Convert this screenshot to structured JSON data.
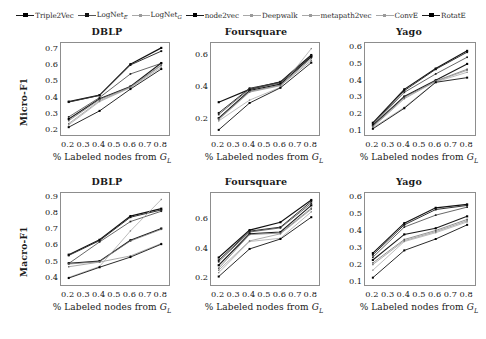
{
  "legend": {
    "entries": [
      {
        "label": "Triple2Vec",
        "sub": "",
        "style": "bold"
      },
      {
        "label": "LogNet",
        "sub": "E",
        "style": "normal"
      },
      {
        "label": "LogNet",
        "sub": "G",
        "style": "light"
      },
      {
        "label": "node2vec",
        "sub": "",
        "style": "bold"
      },
      {
        "label": "Deepwalk",
        "sub": "",
        "style": "light"
      },
      {
        "label": "metapath2vec",
        "sub": "",
        "style": "light"
      },
      {
        "label": "ConvE",
        "sub": "",
        "style": "light"
      },
      {
        "label": "RotatE",
        "sub": "",
        "style": "bold"
      }
    ]
  },
  "axes": {
    "xlabel_prefix": "% Labeled nodes from ",
    "xlabel_symbol": "G",
    "xlabel_sub": "L",
    "ylabel_micro": "Micro-F1",
    "ylabel_macro": "Macro-F1"
  },
  "chart_data": [
    {
      "type": "line",
      "title": "DBLP",
      "panel": "micro-dblp",
      "xlabel": "% Labeled nodes from G_L",
      "ylabel": "Micro-F1",
      "x": [
        0.2,
        0.4,
        0.6,
        0.8
      ],
      "xticks": [
        0.2,
        0.3,
        0.4,
        0.5,
        0.6,
        0.7,
        0.8
      ],
      "xlim": [
        0.15,
        0.85
      ],
      "yticks": [
        0.2,
        0.3,
        0.4,
        0.5,
        0.6,
        0.7
      ],
      "ylim": [
        0.17,
        0.735
      ],
      "grid": false,
      "series": [
        {
          "name": "Triple2Vec",
          "values": [
            0.375,
            0.415,
            0.605,
            0.705
          ]
        },
        {
          "name": "LogNet_E",
          "values": [
            0.372,
            0.413,
            0.6,
            0.685
          ]
        },
        {
          "name": "LogNet_G",
          "values": [
            0.281,
            0.4,
            0.545,
            0.61
          ]
        },
        {
          "name": "node2vec",
          "values": [
            0.268,
            0.392,
            0.468,
            0.612
          ]
        },
        {
          "name": "Deepwalk",
          "values": [
            0.258,
            0.388,
            0.465,
            0.6
          ]
        },
        {
          "name": "metapath2vec",
          "values": [
            0.24,
            0.38,
            0.462,
            0.596
          ]
        },
        {
          "name": "ConvE",
          "values": [
            0.232,
            0.375,
            0.46,
            0.585
          ]
        },
        {
          "name": "RotatE",
          "values": [
            0.218,
            0.318,
            0.452,
            0.575
          ]
        }
      ]
    },
    {
      "type": "line",
      "title": "Foursquare",
      "panel": "micro-foursquare",
      "xlabel": "% Labeled nodes from G_L",
      "ylabel": "Micro-F1",
      "x": [
        0.2,
        0.4,
        0.6,
        0.8
      ],
      "xticks": [
        0.2,
        0.3,
        0.4,
        0.5,
        0.6,
        0.7,
        0.8
      ],
      "xlim": [
        0.15,
        0.85
      ],
      "yticks": [
        0.2,
        0.4,
        0.6
      ],
      "ylim": [
        0.1,
        0.675
      ],
      "grid": false,
      "series": [
        {
          "name": "Triple2Vec",
          "values": [
            0.305,
            0.385,
            0.432,
            0.6
          ]
        },
        {
          "name": "LogNet_E",
          "values": [
            0.238,
            0.392,
            0.43,
            0.595
          ]
        },
        {
          "name": "LogNet_G",
          "values": [
            0.228,
            0.388,
            0.425,
            0.592
          ]
        },
        {
          "name": "node2vec",
          "values": [
            0.205,
            0.378,
            0.418,
            0.588
          ]
        },
        {
          "name": "Deepwalk",
          "values": [
            0.2,
            0.372,
            0.412,
            0.578
          ]
        },
        {
          "name": "metapath2vec",
          "values": [
            0.196,
            0.368,
            0.408,
            0.565
          ]
        },
        {
          "name": "ConvE",
          "values": [
            0.188,
            0.318,
            0.398,
            0.64
          ]
        },
        {
          "name": "RotatE",
          "values": [
            0.132,
            0.3,
            0.395,
            0.552
          ]
        }
      ]
    },
    {
      "type": "line",
      "title": "Yago",
      "panel": "micro-yago",
      "xlabel": "% Labeled nodes from G_L",
      "ylabel": "Micro-F1",
      "x": [
        0.2,
        0.4,
        0.6,
        0.8
      ],
      "xticks": [
        0.2,
        0.3,
        0.4,
        0.5,
        0.6,
        0.7,
        0.8
      ],
      "xlim": [
        0.15,
        0.85
      ],
      "yticks": [
        0.1,
        0.2,
        0.3,
        0.4,
        0.5,
        0.6
      ],
      "ylim": [
        0.075,
        0.625
      ],
      "grid": false,
      "series": [
        {
          "name": "Triple2Vec",
          "values": [
            0.148,
            0.348,
            0.472,
            0.578
          ]
        },
        {
          "name": "LogNet_E",
          "values": [
            0.142,
            0.34,
            0.468,
            0.57
          ]
        },
        {
          "name": "LogNet_G",
          "values": [
            0.135,
            0.33,
            0.44,
            0.54
          ]
        },
        {
          "name": "node2vec",
          "values": [
            0.132,
            0.305,
            0.402,
            0.5
          ]
        },
        {
          "name": "Deepwalk",
          "values": [
            0.128,
            0.3,
            0.398,
            0.468
          ]
        },
        {
          "name": "metapath2vec",
          "values": [
            0.122,
            0.292,
            0.395,
            0.462
          ]
        },
        {
          "name": "ConvE",
          "values": [
            0.118,
            0.24,
            0.392,
            0.45
          ]
        },
        {
          "name": "RotatE",
          "values": [
            0.112,
            0.235,
            0.39,
            0.418
          ]
        }
      ]
    },
    {
      "type": "line",
      "title": "DBLP",
      "panel": "macro-dblp",
      "xlabel": "% Labeled nodes from G_L",
      "ylabel": "Macro-F1",
      "x": [
        0.2,
        0.4,
        0.6,
        0.8
      ],
      "xticks": [
        0.2,
        0.3,
        0.4,
        0.5,
        0.6,
        0.7,
        0.8
      ],
      "xlim": [
        0.15,
        0.85
      ],
      "yticks": [
        0.4,
        0.5,
        0.6,
        0.7,
        0.8,
        0.9
      ],
      "ylim": [
        0.355,
        0.925
      ],
      "grid": false,
      "series": [
        {
          "name": "Triple2Vec",
          "values": [
            0.543,
            0.635,
            0.782,
            0.828
          ]
        },
        {
          "name": "LogNet_E",
          "values": [
            0.538,
            0.63,
            0.775,
            0.82
          ]
        },
        {
          "name": "LogNet_G",
          "values": [
            0.488,
            0.622,
            0.748,
            0.812
          ]
        },
        {
          "name": "node2vec",
          "values": [
            0.49,
            0.503,
            0.632,
            0.705
          ]
        },
        {
          "name": "Deepwalk",
          "values": [
            0.485,
            0.5,
            0.628,
            0.7
          ]
        },
        {
          "name": "metapath2vec",
          "values": [
            0.468,
            0.497,
            0.535,
            0.612
          ]
        },
        {
          "name": "ConvE",
          "values": [
            0.402,
            0.47,
            0.69,
            0.885
          ]
        },
        {
          "name": "RotatE",
          "values": [
            0.398,
            0.465,
            0.528,
            0.608
          ]
        }
      ]
    },
    {
      "type": "line",
      "title": "Foursquare",
      "panel": "macro-foursquare",
      "xlabel": "% Labeled nodes from G_L",
      "ylabel": "Macro-F1",
      "x": [
        0.2,
        0.4,
        0.6,
        0.8
      ],
      "xticks": [
        0.2,
        0.3,
        0.4,
        0.5,
        0.6,
        0.7,
        0.8
      ],
      "xlim": [
        0.15,
        0.85
      ],
      "yticks": [
        0.2,
        0.4,
        0.6
      ],
      "ylim": [
        0.155,
        0.775
      ],
      "grid": false,
      "series": [
        {
          "name": "Triple2Vec",
          "values": [
            0.34,
            0.525,
            0.578,
            0.728
          ]
        },
        {
          "name": "LogNet_E",
          "values": [
            0.322,
            0.518,
            0.545,
            0.718
          ]
        },
        {
          "name": "LogNet_G",
          "values": [
            0.312,
            0.512,
            0.54,
            0.705
          ]
        },
        {
          "name": "node2vec",
          "values": [
            0.288,
            0.5,
            0.512,
            0.692
          ]
        },
        {
          "name": "Deepwalk",
          "values": [
            0.268,
            0.495,
            0.505,
            0.672
          ]
        },
        {
          "name": "metapath2vec",
          "values": [
            0.255,
            0.452,
            0.5,
            0.665
          ]
        },
        {
          "name": "ConvE",
          "values": [
            0.238,
            0.448,
            0.47,
            0.648
          ]
        },
        {
          "name": "RotatE",
          "values": [
            0.212,
            0.398,
            0.465,
            0.612
          ]
        }
      ]
    },
    {
      "type": "line",
      "title": "Yago",
      "panel": "macro-yago",
      "xlabel": "% Labeled nodes from G_L",
      "ylabel": "Macro-F1",
      "x": [
        0.2,
        0.4,
        0.6,
        0.8
      ],
      "xticks": [
        0.2,
        0.3,
        0.4,
        0.5,
        0.6,
        0.7,
        0.8
      ],
      "xlim": [
        0.15,
        0.85
      ],
      "yticks": [
        0.1,
        0.2,
        0.3,
        0.4,
        0.5,
        0.6
      ],
      "ylim": [
        0.085,
        0.625
      ],
      "grid": false,
      "series": [
        {
          "name": "Triple2Vec",
          "values": [
            0.272,
            0.448,
            0.538,
            0.558
          ]
        },
        {
          "name": "LogNet_E",
          "values": [
            0.262,
            0.438,
            0.528,
            0.552
          ]
        },
        {
          "name": "LogNet_G",
          "values": [
            0.248,
            0.425,
            0.495,
            0.542
          ]
        },
        {
          "name": "node2vec",
          "values": [
            0.232,
            0.382,
            0.418,
            0.488
          ]
        },
        {
          "name": "Deepwalk",
          "values": [
            0.215,
            0.352,
            0.405,
            0.47
          ]
        },
        {
          "name": "metapath2vec",
          "values": [
            0.205,
            0.345,
            0.398,
            0.462
          ]
        },
        {
          "name": "ConvE",
          "values": [
            0.172,
            0.34,
            0.392,
            0.455
          ]
        },
        {
          "name": "RotatE",
          "values": [
            0.128,
            0.288,
            0.355,
            0.438
          ]
        }
      ]
    }
  ]
}
